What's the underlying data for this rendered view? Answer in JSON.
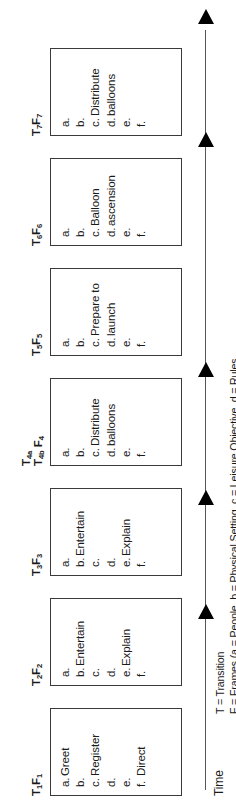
{
  "figure": {
    "type": "timeline-frame-diagram",
    "axis_label": "Time",
    "legend": [
      "T = Transition",
      "F = Frames (a = People, b = Physical Setting, c = Leisure Objective, d = Rules"
    ]
  },
  "frames": [
    {
      "id": "f1",
      "t_label": "T",
      "t_sub": "1",
      "f_label": "F",
      "f_sub": "1",
      "label_lines": [
        "T1F1"
      ],
      "items": [
        {
          "letter": "a.",
          "text": "Greet"
        },
        {
          "letter": "b.",
          "text": ""
        },
        {
          "letter": "c.",
          "text": "Register"
        },
        {
          "letter": "d.",
          "text": ""
        },
        {
          "letter": "e.",
          "text": ""
        },
        {
          "letter": "f.",
          "text": "Direct"
        }
      ],
      "continuation": ""
    },
    {
      "id": "f2",
      "t_label": "T",
      "t_sub": "2",
      "f_label": "F",
      "f_sub": "2",
      "label_lines": [
        "T2F2"
      ],
      "items": [
        {
          "letter": "a.",
          "text": ""
        },
        {
          "letter": "b.",
          "text": "Entertain"
        },
        {
          "letter": "c.",
          "text": ""
        },
        {
          "letter": "d.",
          "text": ""
        },
        {
          "letter": "e.",
          "text": "Explain"
        },
        {
          "letter": "f.",
          "text": ""
        }
      ],
      "continuation": ""
    },
    {
      "id": "f3",
      "t_label": "T",
      "t_sub": "3",
      "f_label": "F",
      "f_sub": "3",
      "label_lines": [
        "T3F3"
      ],
      "items": [
        {
          "letter": "a.",
          "text": ""
        },
        {
          "letter": "b.",
          "text": "Entertain"
        },
        {
          "letter": "c.",
          "text": ""
        },
        {
          "letter": "d.",
          "text": ""
        },
        {
          "letter": "e.",
          "text": "Explain"
        },
        {
          "letter": "f.",
          "text": ""
        }
      ],
      "continuation": ""
    },
    {
      "id": "f4",
      "t_label": "T",
      "t_sub": "4a",
      "t_label2": "T",
      "t_sub2": "4b",
      "f_label": "F",
      "f_sub": "4",
      "label_lines": [
        "T4a",
        "T4b F4"
      ],
      "items": [
        {
          "letter": "a.",
          "text": ""
        },
        {
          "letter": "b.",
          "text": ""
        },
        {
          "letter": "c.",
          "text": "Distribute"
        },
        {
          "letter": "d.",
          "text": ""
        },
        {
          "letter": "e.",
          "text": ""
        },
        {
          "letter": "f.",
          "text": ""
        }
      ],
      "continuation": "balloons"
    },
    {
      "id": "f5",
      "t_label": "T",
      "t_sub": "5",
      "f_label": "F",
      "f_sub": "5",
      "label_lines": [
        "T5F5"
      ],
      "items": [
        {
          "letter": "a.",
          "text": ""
        },
        {
          "letter": "b.",
          "text": ""
        },
        {
          "letter": "c.",
          "text": "Prepare to"
        },
        {
          "letter": "d.",
          "text": ""
        },
        {
          "letter": "e.",
          "text": ""
        },
        {
          "letter": "f.",
          "text": ""
        }
      ],
      "continuation": "launch"
    },
    {
      "id": "f6",
      "t_label": "T",
      "t_sub": "6",
      "f_label": "F",
      "f_sub": "6",
      "label_lines": [
        "T6F6"
      ],
      "items": [
        {
          "letter": "a.",
          "text": ""
        },
        {
          "letter": "b.",
          "text": ""
        },
        {
          "letter": "c.",
          "text": "Balloon"
        },
        {
          "letter": "d.",
          "text": ""
        },
        {
          "letter": "e.",
          "text": ""
        },
        {
          "letter": "f.",
          "text": ""
        }
      ],
      "continuation": "ascension"
    },
    {
      "id": "f7",
      "t_label": "T",
      "t_sub": "7",
      "f_label": "F",
      "f_sub": "7",
      "label_lines": [
        "T7F7"
      ],
      "items": [
        {
          "letter": "a.",
          "text": ""
        },
        {
          "letter": "b.",
          "text": ""
        },
        {
          "letter": "c.",
          "text": "Distribute"
        },
        {
          "letter": "d.",
          "text": ""
        },
        {
          "letter": "e.",
          "text": ""
        },
        {
          "letter": "f.",
          "text": ""
        }
      ],
      "continuation": "balloons"
    }
  ],
  "transitions": [
    {
      "id": "arrow-1"
    },
    {
      "id": "arrow-2"
    },
    {
      "id": "arrow-3"
    },
    {
      "id": "arrow-4"
    },
    {
      "id": "arrow-5"
    }
  ]
}
